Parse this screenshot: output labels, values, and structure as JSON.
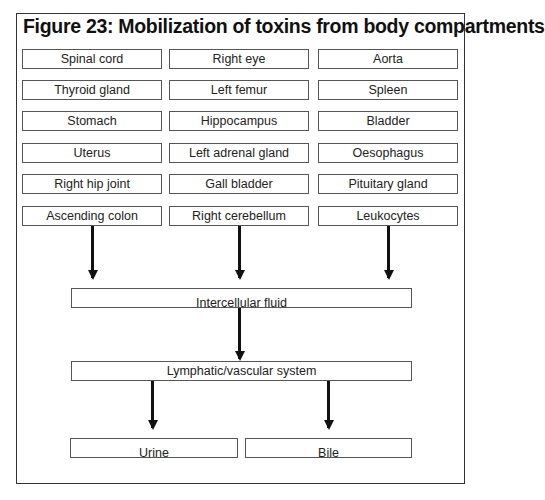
{
  "figure": {
    "title": "Figure 23: Mobilization of toxins from body compartments"
  },
  "compartments": {
    "column_1": [
      "Spinal cord",
      "Thyroid gland",
      "Stomach",
      "Uterus",
      "Right hip joint",
      "Ascending colon"
    ],
    "column_2": [
      "Right eye",
      "Left femur",
      "Hippocampus",
      "Left adrenal gland",
      "Gall bladder",
      "Right cerebellum"
    ],
    "column_3": [
      "Aorta",
      "Spleen",
      "Bladder",
      "Oesophagus",
      "Pituitary gland",
      "Leukocytes"
    ]
  },
  "flow": {
    "intermediate_1": "Intercellular fluid",
    "intermediate_2": "Lymphatic/vascular system",
    "outputs": [
      "Urine",
      "Bile"
    ]
  },
  "edges": [
    {
      "from": "column_1",
      "to": "Intercellular fluid"
    },
    {
      "from": "column_2",
      "to": "Intercellular fluid"
    },
    {
      "from": "column_3",
      "to": "Intercellular fluid"
    },
    {
      "from": "Intercellular fluid",
      "to": "Lymphatic/vascular system"
    },
    {
      "from": "Lymphatic/vascular system",
      "to": "Urine"
    },
    {
      "from": "Lymphatic/vascular system",
      "to": "Bile"
    }
  ]
}
